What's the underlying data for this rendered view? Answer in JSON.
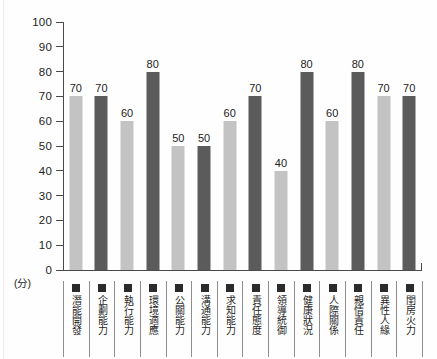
{
  "chart_data": {
    "type": "bar",
    "title": "",
    "subtitle": "",
    "xlabel": "",
    "ylabel": "",
    "unit_label": "(分)",
    "ylim": [
      0,
      100
    ],
    "ytick_step": 10,
    "ytick_labels": [
      "100",
      "90",
      "80",
      "70",
      "60",
      "50",
      "40",
      "30",
      "20",
      "10",
      "0"
    ],
    "grid": false,
    "legend_position": "none",
    "colors": {
      "light_bar": "#c3c3c3",
      "dark_bar": "#5b5b5b",
      "axis": "#4a4a4a",
      "swatch": "#2b2b2b",
      "text": "#222222",
      "background": "#fefefe"
    },
    "categories": [
      "潛能開發",
      "企劃能力",
      "執行能力",
      "環境適應",
      "公關能力",
      "溝通能力",
      "求知能力",
      "責任態度",
      "領導統御",
      "健康狀況",
      "人際關係",
      "親情責任",
      "異性人緣",
      "閨房火力"
    ],
    "values": [
      70,
      70,
      60,
      80,
      50,
      50,
      60,
      70,
      40,
      80,
      60,
      80,
      70,
      70
    ],
    "bar_shades": [
      "light",
      "dark",
      "light",
      "dark",
      "light",
      "dark",
      "light",
      "dark",
      "light",
      "dark",
      "light",
      "dark",
      "light",
      "dark"
    ],
    "value_labels": [
      "70",
      "70",
      "60",
      "80",
      "50",
      "50",
      "60",
      "70",
      "40",
      "80",
      "60",
      "80",
      "70",
      "70"
    ]
  }
}
